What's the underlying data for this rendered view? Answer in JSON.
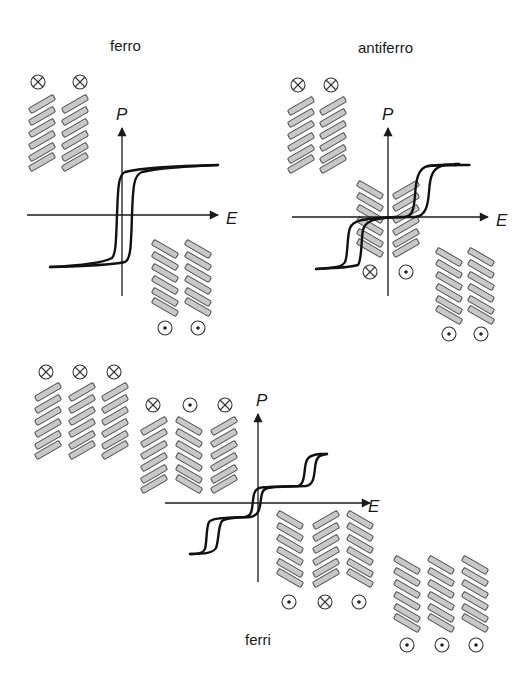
{
  "panels": {
    "ferro": {
      "title": "ferro",
      "p_label": "P",
      "e_label": "E",
      "domains_top": [
        "cross",
        "cross"
      ],
      "domains_bottom": [
        "dot",
        "dot"
      ]
    },
    "antiferro": {
      "title": "antiferro",
      "p_label": "P",
      "e_label": "E",
      "domains_top": [
        "cross",
        "cross"
      ],
      "domains_center": [
        "cross",
        "dot"
      ],
      "domains_bottom": [
        "dot",
        "dot"
      ]
    },
    "ferri": {
      "title": "ferri",
      "p_label": "P",
      "e_label": "E",
      "domains_top_left": [
        "cross",
        "cross",
        "cross"
      ],
      "domains_top_mid": [
        "cross",
        "dot",
        "cross"
      ],
      "domains_bottom_mid": [
        "dot",
        "cross",
        "dot"
      ],
      "domains_bottom_right": [
        "dot",
        "dot",
        "dot"
      ]
    }
  },
  "symbols": {
    "cross": "⊗ (into page)",
    "dot": "⊙ (out of page)"
  },
  "colors": {
    "rod_fill": "#c8c8c8",
    "rod_stroke": "#4a4a4a",
    "line": "#111111",
    "background": "#ffffff"
  }
}
